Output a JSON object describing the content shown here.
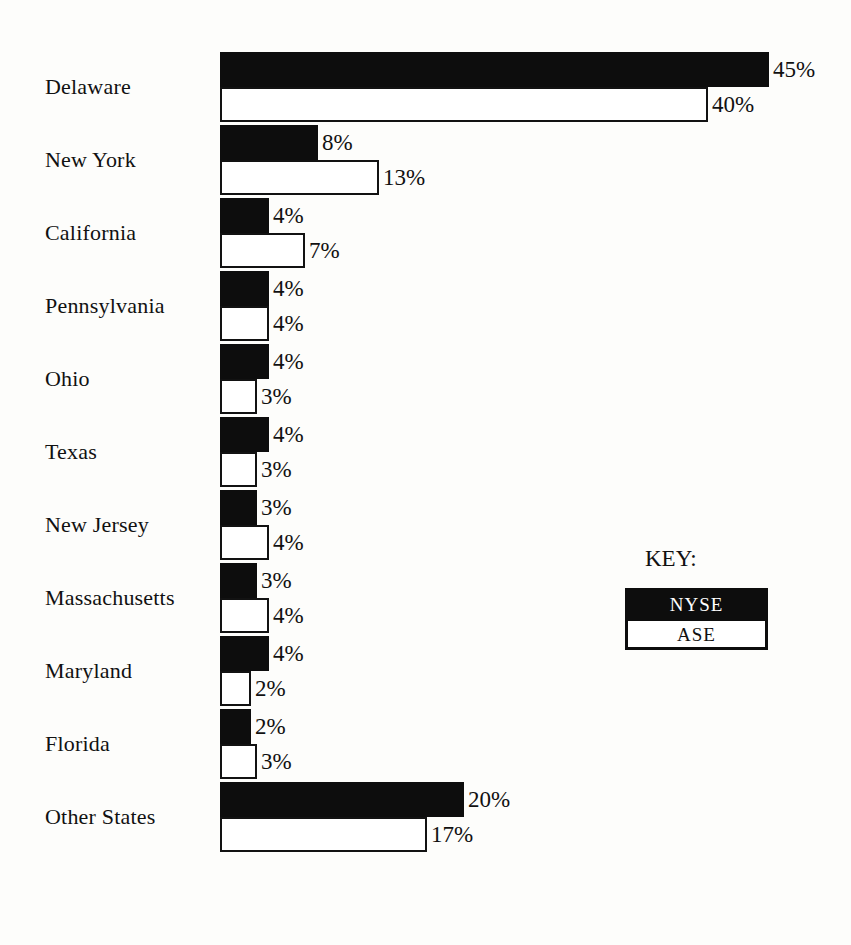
{
  "chart_data": {
    "type": "bar",
    "orientation": "horizontal",
    "title": "",
    "subtitle": "",
    "xlabel": "",
    "ylabel": "",
    "grid": false,
    "axis_visible": false,
    "value_suffix": "%",
    "xlim": [
      0,
      45
    ],
    "categories": [
      "Delaware",
      "New York",
      "California",
      "Pennsylvania",
      "Ohio",
      "Texas",
      "New Jersey",
      "Massachusetts",
      "Maryland",
      "Florida",
      "Other States"
    ],
    "series": [
      {
        "name": "NYSE",
        "color": "#0d0d0d",
        "values": [
          45,
          8,
          4,
          4,
          4,
          4,
          3,
          3,
          4,
          2,
          20
        ],
        "labels": [
          "45%",
          "8%",
          "4%",
          "4%",
          "4%",
          "4%",
          "3%",
          "3%",
          "4%",
          "2%",
          "20%"
        ]
      },
      {
        "name": "ASE",
        "color": "#ffffff",
        "values": [
          40,
          13,
          7,
          4,
          3,
          3,
          4,
          4,
          2,
          3,
          17
        ],
        "labels": [
          "40%",
          "13%",
          "7%",
          "4%",
          "3%",
          "3%",
          "4%",
          "4%",
          "2%",
          "3%",
          "17%"
        ]
      }
    ],
    "legend": {
      "title": "KEY:",
      "position": "right-middle",
      "entries": [
        {
          "label": "NYSE",
          "swatch": "black-fill"
        },
        {
          "label": "ASE",
          "swatch": "white-fill-black-outline"
        }
      ]
    },
    "colors": {
      "background": "#fdfdfb",
      "ink": "#111111",
      "nyse_fill": "#0d0d0d",
      "ase_fill": "#ffffff",
      "ase_outline": "#121212"
    }
  },
  "rows": [
    {
      "label": "Delaware",
      "nyse": 45,
      "nyse_label": "45%",
      "ase": 40,
      "ase_label": "40%"
    },
    {
      "label": "New York",
      "nyse": 8,
      "nyse_label": "8%",
      "ase": 13,
      "ase_label": "13%"
    },
    {
      "label": "California",
      "nyse": 4,
      "nyse_label": "4%",
      "ase": 7,
      "ase_label": "7%"
    },
    {
      "label": "Pennsylvania",
      "nyse": 4,
      "nyse_label": "4%",
      "ase": 4,
      "ase_label": "4%"
    },
    {
      "label": "Ohio",
      "nyse": 4,
      "nyse_label": "4%",
      "ase": 3,
      "ase_label": "3%"
    },
    {
      "label": "Texas",
      "nyse": 4,
      "nyse_label": "4%",
      "ase": 3,
      "ase_label": "3%"
    },
    {
      "label": "New Jersey",
      "nyse": 3,
      "nyse_label": "3%",
      "ase": 4,
      "ase_label": "4%"
    },
    {
      "label": "Massachusetts",
      "nyse": 3,
      "nyse_label": "3%",
      "ase": 4,
      "ase_label": "4%"
    },
    {
      "label": "Maryland",
      "nyse": 4,
      "nyse_label": "4%",
      "ase": 2,
      "ase_label": "2%"
    },
    {
      "label": "Florida",
      "nyse": 2,
      "nyse_label": "2%",
      "ase": 3,
      "ase_label": "3%"
    },
    {
      "label": "Other States",
      "nyse": 20,
      "nyse_label": "20%",
      "ase": 17,
      "ase_label": "17%"
    }
  ],
  "legend": {
    "title": "KEY:",
    "nyse_label": "NYSE",
    "ase_label": "ASE"
  },
  "layout": {
    "bar_origin_x": 220,
    "px_per_percent": 12.2,
    "min_bar_px": 31,
    "row_pitch": 73,
    "first_row_top": 52,
    "last_row_top": 822,
    "legend_left": 625,
    "legend_title_top": 546,
    "legend_box_top": 588,
    "legend_box_width": 143
  }
}
